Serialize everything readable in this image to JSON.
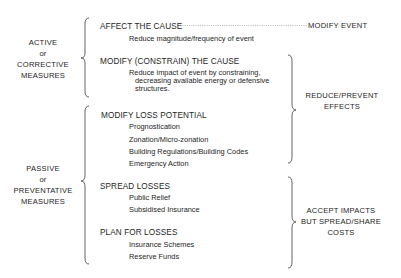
{
  "left_groups": [
    {
      "lines": [
        "ACTIVE",
        "or",
        "CORRECTIVE",
        "MEASURES"
      ]
    },
    {
      "lines": [
        "PASSIVE",
        "or",
        "PREVENTATIVE",
        "MEASURES"
      ]
    }
  ],
  "strategies": [
    {
      "title": "AFFECT THE CAUSE",
      "items": [
        "Reduce magnitude/frequency of event"
      ]
    },
    {
      "title": "MODIFY (CONSTRAIN) THE CAUSE",
      "items": [
        "Reduce impact of event by constraining,",
        "decreasing available energy or defensive",
        "structures."
      ]
    },
    {
      "title": "MODIFY LOSS POTENTIAL",
      "items": [
        "Prognostication",
        "Zonation/Micro-zonation",
        "Building Regulations/Building Codes",
        "Emergency Action"
      ]
    },
    {
      "title": "SPREAD LOSSES",
      "items": [
        "Public Relief",
        "Subsidised Insurance"
      ]
    },
    {
      "title": "PLAN FOR LOSSES",
      "items": [
        "Insurance Schemes",
        "Reserve Funds"
      ]
    }
  ],
  "right_groups": [
    {
      "lines": [
        "MODIFY EVENT"
      ]
    },
    {
      "lines": [
        "REDUCE/PREVENT",
        "EFFECTS"
      ]
    },
    {
      "lines": [
        "ACCEPT IMPACTS",
        "BUT SPREAD/SHARE",
        "COSTS"
      ]
    }
  ]
}
